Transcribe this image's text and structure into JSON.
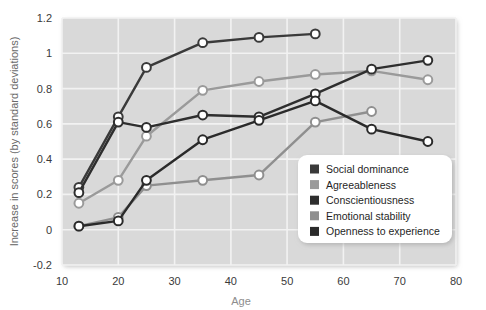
{
  "chart_data": {
    "type": "line",
    "title": "",
    "xlabel": "Age",
    "ylabel": "Increase in scores (by standard deviations)",
    "xlim": [
      10,
      80
    ],
    "ylim": [
      -0.2,
      1.2
    ],
    "xticks": [
      10,
      20,
      30,
      40,
      50,
      60,
      70,
      80
    ],
    "yticks": [
      -0.2,
      0,
      0.2,
      0.4,
      0.6,
      0.8,
      1,
      1.2
    ],
    "ytick_labels": [
      "-0.2",
      "0",
      "0.2",
      "0.4",
      "0.6",
      "0.8",
      "1",
      "1.2"
    ],
    "xtick_labels": [
      "10",
      "20",
      "30",
      "40",
      "50",
      "60",
      "70",
      "80"
    ],
    "grid": true,
    "legend_position": "bottom-right",
    "markers": "open-circle",
    "series": [
      {
        "name": "Social dominance",
        "color": "#3a3a3a",
        "x": [
          13,
          20,
          25,
          35,
          45,
          55
        ],
        "values": [
          0.24,
          0.64,
          0.92,
          1.06,
          1.09,
          1.11
        ]
      },
      {
        "name": "Agreeableness",
        "color": "#9a9a9a",
        "x": [
          13,
          20,
          25,
          35,
          45,
          55,
          65,
          75
        ],
        "values": [
          0.15,
          0.28,
          0.53,
          0.79,
          0.84,
          0.88,
          0.9,
          0.85
        ]
      },
      {
        "name": "Conscientiousness",
        "color": "#2e2e2e",
        "x": [
          13,
          20,
          25,
          35,
          45,
          55,
          65,
          75
        ],
        "values": [
          0.21,
          0.61,
          0.58,
          0.65,
          0.64,
          0.77,
          0.91,
          0.96
        ]
      },
      {
        "name": "Emotional stability",
        "color": "#8f8f8f",
        "x": [
          13,
          20,
          25,
          35,
          45,
          55,
          65
        ],
        "values": [
          0.02,
          0.07,
          0.25,
          0.28,
          0.31,
          0.61,
          0.67
        ]
      },
      {
        "name": "Openness to experience",
        "color": "#2a2a2a",
        "x": [
          13,
          20,
          25,
          35,
          45,
          55,
          65,
          75
        ],
        "values": [
          0.02,
          0.05,
          0.28,
          0.51,
          0.62,
          0.73,
          0.57,
          0.5
        ]
      }
    ]
  },
  "legend": {
    "items": [
      {
        "label": "Social dominance",
        "color": "#3a3a3a"
      },
      {
        "label": "Agreeableness",
        "color": "#9a9a9a"
      },
      {
        "label": "Conscientiousness",
        "color": "#2e2e2e"
      },
      {
        "label": "Emotional stability",
        "color": "#8f8f8f"
      },
      {
        "label": "Openness to experience",
        "color": "#2a2a2a"
      }
    ]
  },
  "style": {
    "plot_background": "#d9d9d9",
    "page_background": "#ffffff",
    "grid_color": "#f2f2f2",
    "legend_background": "#ffffff"
  }
}
